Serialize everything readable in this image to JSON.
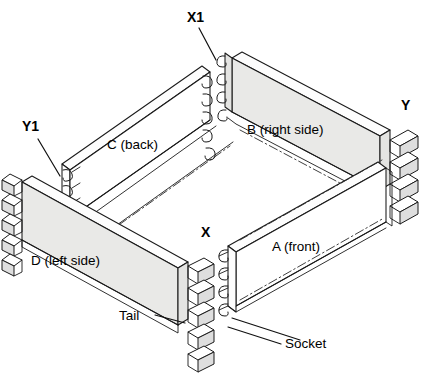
{
  "diagram": {
    "background_color": "#ffffff",
    "line_color": "#1a1a1a",
    "shaded_panel_color": "#e9e9e7",
    "plain_panel_color": "#ffffff"
  },
  "panels": [
    {
      "id": "A",
      "label": "A (front)",
      "role": "front",
      "shaded": false,
      "joint_type": "socket",
      "label_x": 272,
      "label_y": 251
    },
    {
      "id": "B",
      "label": "B (right side)",
      "role": "right-side",
      "shaded": true,
      "joint_type": "tail",
      "label_x": 247,
      "label_y": 134
    },
    {
      "id": "C",
      "label": "C (back)",
      "role": "back",
      "shaded": false,
      "joint_type": "socket",
      "label_x": 107,
      "label_y": 149
    },
    {
      "id": "D",
      "label": "D (left side)",
      "role": "left-side",
      "shaded": true,
      "joint_type": "tail",
      "label_x": 31,
      "label_y": 265
    }
  ],
  "corner_labels": [
    {
      "id": "X1",
      "text": "X1",
      "x": 187,
      "y": 22,
      "leader": true
    },
    {
      "id": "Y1",
      "text": "Y1",
      "x": 22,
      "y": 131,
      "leader": true
    },
    {
      "id": "Y",
      "text": "Y",
      "x": 401,
      "y": 110,
      "leader": false
    },
    {
      "id": "X",
      "text": "X",
      "x": 201,
      "y": 237,
      "leader": false
    }
  ],
  "callouts": [
    {
      "id": "tail",
      "text": "Tail",
      "x": 119,
      "y": 320,
      "leader_from": [
        152,
        315
      ],
      "leader_to": [
        183,
        322
      ]
    },
    {
      "id": "socket",
      "text": "Socket",
      "x": 285,
      "y": 348,
      "leader_from": [
        280,
        344
      ],
      "leader_to": [
        228,
        327
      ]
    }
  ],
  "legend_terms": {
    "tail": "Tail",
    "socket": "Socket"
  }
}
